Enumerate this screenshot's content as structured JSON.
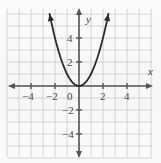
{
  "figure": {
    "name": "coordinate-plane-parabola-graph",
    "width": 161,
    "height": 163,
    "background_color": "#fbfbfb"
  },
  "axes": {
    "x_title": "x",
    "y_title": "y",
    "origin_label": "0",
    "axis_color": "#555555",
    "grid_color": "#cfcfcf",
    "label_color": "#4a4a4a",
    "x_range": [
      -5.9,
      5.9
    ],
    "y_range": [
      -5.9,
      6.4
    ],
    "grid_step": 1,
    "grid": true,
    "arrowheads": [
      "left",
      "right",
      "up",
      "down"
    ],
    "x_ticks": [
      {
        "value": -4,
        "label": "−4"
      },
      {
        "value": -2,
        "label": "−2"
      },
      {
        "value": 2,
        "label": "2"
      },
      {
        "value": 4,
        "label": "4"
      }
    ],
    "y_ticks": [
      {
        "value": 4,
        "label": "4"
      },
      {
        "value": 2,
        "label": "2"
      },
      {
        "value": -2,
        "label": "−2"
      },
      {
        "value": -4,
        "label": "−4"
      }
    ]
  },
  "chart_data": {
    "type": "line",
    "title": "",
    "xlabel": "x",
    "ylabel": "y",
    "xlim": [
      -5.9,
      5.9
    ],
    "ylim": [
      -5.9,
      6.4
    ],
    "grid": true,
    "legend": false,
    "series": [
      {
        "name": "y = x^2",
        "equation": "y = x²",
        "color": "#2b2b2b",
        "vertex": [
          0,
          0
        ],
        "arrows_both_ends": true,
        "x": [
          -2.45,
          -2.3,
          -2.1,
          -1.9,
          -1.7,
          -1.5,
          -1.3,
          -1.1,
          -0.9,
          -0.7,
          -0.5,
          -0.3,
          -0.1,
          0,
          0.1,
          0.3,
          0.5,
          0.7,
          0.9,
          1.1,
          1.3,
          1.5,
          1.7,
          1.9,
          2.1,
          2.3,
          2.45
        ],
        "values": [
          6.0,
          5.29,
          4.41,
          3.61,
          2.89,
          2.25,
          1.69,
          1.21,
          0.81,
          0.49,
          0.25,
          0.09,
          0.01,
          0,
          0.01,
          0.09,
          0.25,
          0.49,
          0.81,
          1.21,
          1.69,
          2.25,
          2.89,
          3.61,
          4.41,
          5.29,
          6.0
        ]
      }
    ]
  }
}
